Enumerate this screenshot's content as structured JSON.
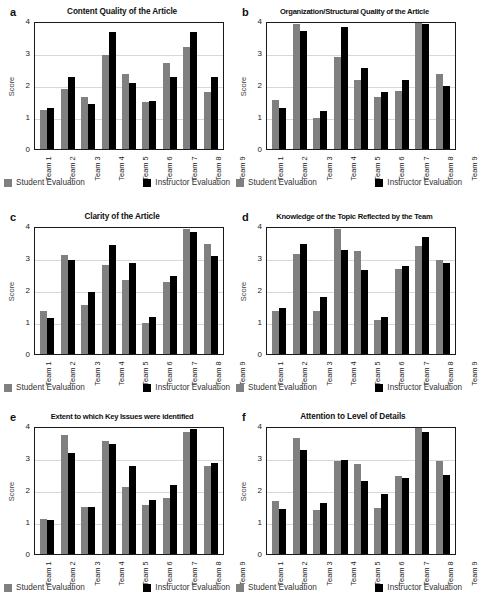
{
  "figure": {
    "axis": {
      "ylabel": "Score",
      "yticks": [
        0,
        1,
        2,
        3,
        4
      ],
      "ymin": 0,
      "ymax": 4
    },
    "legend": {
      "student_label": "Student Evaluation",
      "instructor_label": "Instructor Evaluation",
      "student_color": "#808080",
      "instructor_color": "#000000"
    },
    "categories": [
      "Team 1",
      "Team 2",
      "Team 3",
      "Team 4",
      "Team 5",
      "Team 6",
      "Team 7",
      "Team 8",
      "Team 9"
    ]
  },
  "chart_data": [
    {
      "type": "bar",
      "panel": "a",
      "title": "Content Quality of the Article",
      "xlabel": "",
      "ylabel": "Score",
      "ylim": [
        0,
        4
      ],
      "grid": true,
      "legend_position": "bottom",
      "categories": [
        "Team 1",
        "Team 2",
        "Team 3",
        "Team 4",
        "Team 5",
        "Team 6",
        "Team 7",
        "Team 8",
        "Team 9"
      ],
      "series": [
        {
          "name": "Student Evaluation",
          "values": [
            1.25,
            1.9,
            1.65,
            3.0,
            2.37,
            1.5,
            2.72,
            3.25,
            1.8
          ]
        },
        {
          "name": "Instructor Evaluation",
          "values": [
            1.3,
            2.28,
            1.42,
            3.72,
            2.1,
            1.52,
            2.3,
            3.72,
            2.3
          ]
        }
      ]
    },
    {
      "type": "bar",
      "panel": "b",
      "title": "Organization/Structural Quality of the Article",
      "xlabel": "",
      "ylabel": "Score",
      "ylim": [
        0,
        4
      ],
      "grid": true,
      "legend_position": "bottom",
      "categories": [
        "Team 1",
        "Team 2",
        "Team 3",
        "Team 4",
        "Team 5",
        "Team 6",
        "Team 7",
        "Team 8",
        "Team 9"
      ],
      "series": [
        {
          "name": "Student Evaluation",
          "values": [
            1.55,
            3.97,
            0.97,
            2.92,
            2.2,
            1.65,
            1.85,
            4.0,
            2.38
          ]
        },
        {
          "name": "Instructor Evaluation",
          "values": [
            1.3,
            3.75,
            1.2,
            3.87,
            2.57,
            1.8,
            2.2,
            3.97,
            2.0
          ]
        }
      ]
    },
    {
      "type": "bar",
      "panel": "c",
      "title": "Clarity of the Article",
      "xlabel": "",
      "ylabel": "Score",
      "ylim": [
        0,
        4
      ],
      "grid": true,
      "legend_position": "bottom",
      "categories": [
        "Team 1",
        "Team 2",
        "Team 3",
        "Team 4",
        "Team 5",
        "Team 6",
        "Team 7",
        "Team 8",
        "Team 9"
      ],
      "series": [
        {
          "name": "Student Evaluation",
          "values": [
            1.35,
            3.15,
            1.55,
            2.82,
            2.35,
            0.98,
            2.28,
            3.98,
            3.48
          ]
        },
        {
          "name": "Instructor Evaluation",
          "values": [
            1.15,
            3.0,
            1.97,
            3.47,
            2.9,
            1.18,
            2.47,
            3.87,
            3.1
          ]
        }
      ]
    },
    {
      "type": "bar",
      "panel": "d",
      "title": "Knowledge of the Topic Reflected by the Team",
      "xlabel": "",
      "ylabel": "Score",
      "ylim": [
        0,
        4
      ],
      "grid": true,
      "legend_position": "bottom",
      "categories": [
        "Team 1",
        "Team 2",
        "Team 3",
        "Team 4",
        "Team 5",
        "Team 6",
        "Team 7",
        "Team 8",
        "Team 9"
      ],
      "series": [
        {
          "name": "Student Evaluation",
          "values": [
            1.37,
            3.17,
            1.35,
            3.97,
            3.27,
            1.08,
            2.7,
            3.43,
            3.0
          ]
        },
        {
          "name": "Instructor Evaluation",
          "values": [
            1.47,
            3.48,
            1.8,
            3.3,
            2.68,
            1.18,
            2.8,
            3.7,
            2.88
          ]
        }
      ]
    },
    {
      "type": "bar",
      "panel": "e",
      "title": "Extent to which Key Issues were identified",
      "xlabel": "",
      "ylabel": "Score",
      "ylim": [
        0,
        4
      ],
      "grid": true,
      "legend_position": "bottom",
      "categories": [
        "Team 1",
        "Team 2",
        "Team 3",
        "Team 4",
        "Team 5",
        "Team 6",
        "Team 7",
        "Team 8",
        "Team 9"
      ],
      "series": [
        {
          "name": "Student Evaluation",
          "values": [
            1.1,
            3.78,
            1.48,
            3.6,
            2.13,
            1.57,
            1.77,
            3.88,
            2.8
          ]
        },
        {
          "name": "Instructor Evaluation",
          "values": [
            1.08,
            3.22,
            1.5,
            3.5,
            2.8,
            1.7,
            2.2,
            3.98,
            2.9
          ]
        }
      ]
    },
    {
      "type": "bar",
      "panel": "f",
      "title": "Attention to Level of Details",
      "xlabel": "",
      "ylabel": "Score",
      "ylim": [
        0,
        4
      ],
      "grid": true,
      "legend_position": "bottom",
      "categories": [
        "Team 1",
        "Team 2",
        "Team 3",
        "Team 4",
        "Team 5",
        "Team 6",
        "Team 7",
        "Team 8",
        "Team 9"
      ],
      "series": [
        {
          "name": "Student Evaluation",
          "values": [
            1.68,
            3.67,
            1.4,
            2.95,
            2.87,
            1.47,
            2.47,
            4.0,
            2.95
          ]
        },
        {
          "name": "Instructor Evaluation",
          "values": [
            1.43,
            3.3,
            1.63,
            3.0,
            2.32,
            1.9,
            2.42,
            3.88,
            2.52
          ]
        }
      ]
    }
  ]
}
